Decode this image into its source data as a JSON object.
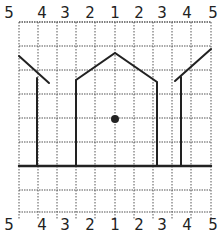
{
  "diagram": {
    "title": "",
    "top_labels": [
      "5",
      "4",
      "3",
      "2",
      "1",
      "2",
      "3",
      "4",
      "5"
    ],
    "bottom_labels": [
      "5",
      "4",
      "3",
      "2",
      "1",
      "2",
      "3",
      "4",
      "5"
    ],
    "grid": {
      "columns": 9,
      "x_lines": [
        19,
        38,
        57,
        76,
        95,
        115,
        134,
        153,
        172,
        191,
        211
      ],
      "y_lines": [
        22,
        46,
        70,
        94,
        118,
        142,
        166,
        190,
        212
      ],
      "line_color": "#555555"
    },
    "ink_color": "#222222",
    "shapes": {
      "ground_line": {
        "x1": 19,
        "y1": 166,
        "x2": 211,
        "y2": 166
      },
      "center_house": {
        "points": [
          [
            76,
            166
          ],
          [
            76,
            80
          ],
          [
            115,
            53
          ],
          [
            157,
            82
          ],
          [
            157,
            166
          ]
        ]
      },
      "left_post": {
        "x1": 37,
        "y1": 78,
        "x2": 37,
        "y2": 166
      },
      "left_roof": {
        "x1": 19,
        "y1": 56,
        "x2": 49,
        "y2": 83
      },
      "right_post": {
        "x1": 181,
        "y1": 77,
        "x2": 181,
        "y2": 166
      },
      "right_roof": {
        "x1": 175,
        "y1": 81,
        "x2": 211,
        "y2": 49
      },
      "center_dot": {
        "cx": 115,
        "cy": 119,
        "r": 4
      }
    }
  }
}
